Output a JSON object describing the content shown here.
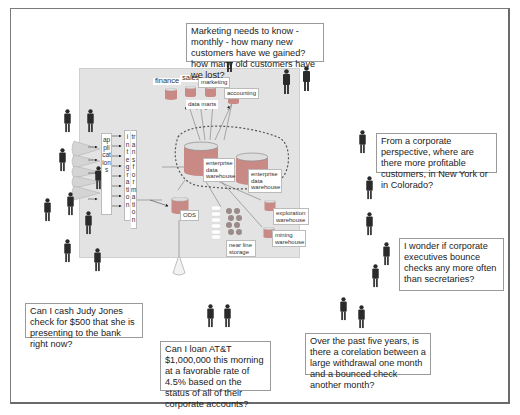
{
  "diagram": {
    "data_marts": {
      "caption": "data marts",
      "items": [
        "finance",
        "sales",
        "marketing",
        "accounting"
      ]
    },
    "applications_label": "applications",
    "integration_label": "integration",
    "transformation_label": "transformation",
    "enterprise_dw_1": "enterprise data warehouse",
    "enterprise_dw_2": "enterprise data warehouse",
    "ods_label": "ODS",
    "near_line_storage": "near line storage",
    "exploration_warehouse": "exploration warehouse",
    "mining_warehouse": "mining warehouse"
  },
  "callouts": {
    "marketing": "Marketing needs to know - monthly - how many new customers have we gained? how many old customers have we lost?",
    "corporate": "From a corporate perspective, where are there more profitable customers, in New York or in Colorado?",
    "executives": "I wonder if corporate executives bounce checks any more often than secretaries?",
    "cash_check": "Can I cash Judy Jones check for $500 that she is presenting to the bank right now?",
    "loan": "Can I loan AT&T $1,000,000 this morning at a favorable rate of 4.5% based on the status of all of their corporate accounts?",
    "correlation": "Over the past five years, is there a corelation between a large withdrawal one month and a bounced check another month?"
  },
  "colors": {
    "panel": "#e3e3e3",
    "cylinder_body": "#c98a86",
    "cylinder_top": "#d9d9d9",
    "person": "#2a2a2a",
    "dashed_border": "#555555",
    "storage_disk": "#9a8a8a"
  }
}
